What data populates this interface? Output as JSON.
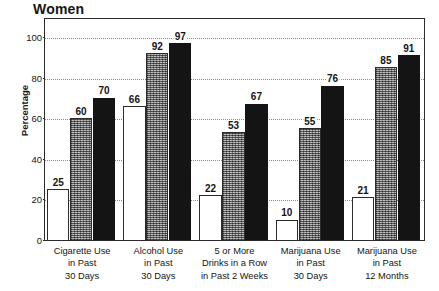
{
  "chart_data": {
    "type": "bar",
    "title": "Women",
    "xlabel": "",
    "ylabel": "Percentage",
    "ylim": [
      0,
      100
    ],
    "yticks": [
      0,
      20,
      40,
      60,
      80,
      100
    ],
    "grid": true,
    "legend_position": "none",
    "categories": [
      [
        "Cigarette Use",
        "in Past",
        "30 Days"
      ],
      [
        "Alcohol Use",
        "in Past",
        "30 Days"
      ],
      [
        "5 or More",
        "Drinks in a Row",
        "in Past 2 Weeks"
      ],
      [
        "Marijuana Use",
        "in Past",
        "30 Days"
      ],
      [
        "Marijuana Use",
        "in Past",
        "12 Months"
      ]
    ],
    "series": [
      {
        "name": "series-1",
        "style": "white",
        "values": [
          25,
          66,
          22,
          10,
          21
        ]
      },
      {
        "name": "series-2",
        "style": "gray",
        "values": [
          60,
          92,
          53,
          55,
          85
        ]
      },
      {
        "name": "series-3",
        "style": "black",
        "values": [
          70,
          97,
          67,
          76,
          91
        ]
      }
    ],
    "value_labels": {
      "series-1": [
        "25",
        "66",
        "22",
        "10",
        "21"
      ],
      "series-2": [
        "60",
        "92",
        "53",
        "55",
        "85"
      ],
      "series-3": [
        "70",
        "97",
        "67",
        "76",
        "91"
      ]
    },
    "colors": {
      "series_white": "#ffffff",
      "series_gray": "#8b8b8b",
      "series_black": "#141414",
      "axis": "#2b2b2b",
      "grid": "#8d8d8d",
      "text": "#151515",
      "background": "#ffffff"
    }
  }
}
